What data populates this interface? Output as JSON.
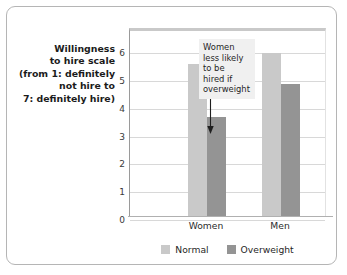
{
  "chart_data": {
    "type": "bar",
    "title": "",
    "xlabel": "",
    "ylabel": "Willingness to hire scale (from 1: definitely not hire to 7: definitely hire)",
    "ylim": [
      0,
      6.8
    ],
    "yticks": [
      0,
      1,
      2,
      3,
      4,
      5,
      6
    ],
    "ytick_labels": [
      "0",
      "1",
      "2",
      "3",
      "4",
      "5",
      "6"
    ],
    "grid": true,
    "legend_position": "bottom-center",
    "categories": [
      "Women",
      "Men"
    ],
    "series": [
      {
        "name": "Normal",
        "color": "#c9c9c9",
        "values": [
          5.5,
          5.9
        ]
      },
      {
        "name": "Overweight",
        "color": "#949494",
        "values": [
          3.6,
          4.8
        ]
      }
    ],
    "annotations": [
      {
        "text": "Women less likely to be hired if overweight",
        "lines": [
          "Women",
          "less likely",
          "to be",
          "hired if",
          "overweight"
        ],
        "points_to": "Women / Overweight bar",
        "arrow": "down-arrow"
      }
    ]
  },
  "y_axis_title": {
    "lines": [
      "Willingness",
      "to hire scale",
      "(from 1: definitely",
      "not hire to",
      "7: definitely hire)"
    ]
  },
  "colors": {
    "normal_bar": "#c9c9c9",
    "overweight_bar": "#949494",
    "gridline": "#d8d8d8",
    "axis": "#9a9a9a",
    "card_border": "#b5b5b5",
    "annotation_background": "#f0f0f0"
  }
}
